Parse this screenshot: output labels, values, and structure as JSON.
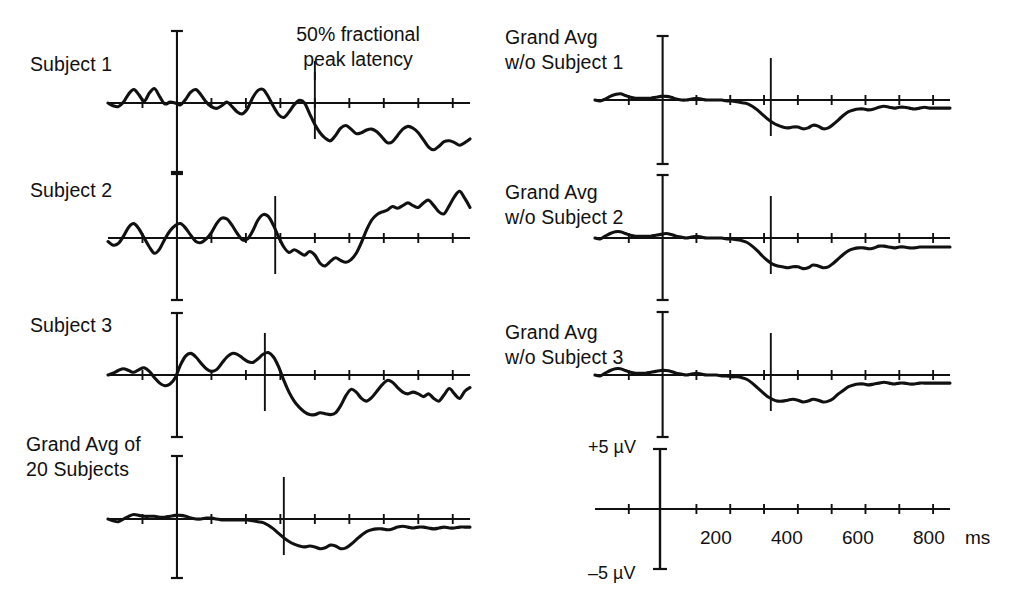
{
  "figure": {
    "title": "",
    "annotation": {
      "line1": "50% fractional",
      "line2": "peak latency"
    },
    "calibration": {
      "positive": "+5 µV",
      "negative": "–5 µV",
      "unit": "ms"
    },
    "time_axis": {
      "tick_labels": [
        "200",
        "400",
        "600",
        "800"
      ],
      "unit_label": "ms",
      "tick_values_ms": [
        -100,
        0,
        100,
        200,
        300,
        400,
        500,
        600,
        700,
        800
      ],
      "range_ms": [
        -200,
        850
      ]
    },
    "left_column": [
      {
        "label": "Subject 1",
        "label_line2": ""
      },
      {
        "label": "Subject 2",
        "label_line2": ""
      },
      {
        "label": "Subject 3",
        "label_line2": ""
      },
      {
        "label": "Grand Avg of",
        "label_line2": "20 Subjects"
      }
    ],
    "right_column": [
      {
        "label": "Grand Avg",
        "label_line2": "w/o Subject 1"
      },
      {
        "label": "Grand Avg",
        "label_line2": "w/o Subject 2"
      },
      {
        "label": "Grand Avg",
        "label_line2": "w/o Subject 3"
      }
    ]
  },
  "chart_data": {
    "type": "line",
    "title": "",
    "xlabel": "ms",
    "ylabel": "µV",
    "xlim": [
      -200,
      850
    ],
    "ylim": [
      -5,
      5
    ],
    "grid": false,
    "legend": "none",
    "xticks": [
      -100,
      0,
      100,
      200,
      300,
      400,
      500,
      600,
      700,
      800
    ],
    "xticklabels": [
      "",
      "",
      "",
      "200",
      "",
      "400",
      "",
      "600",
      "",
      "800"
    ],
    "annotations": [
      {
        "text": "50% fractional peak latency",
        "points_to": "latency-marker-subject-1"
      }
    ],
    "series": [
      {
        "name": "Subject 1",
        "panel": "left-1",
        "latency_marker_ms": 400,
        "x": [
          -200,
          -185,
          -170,
          -155,
          -140,
          -125,
          -110,
          -95,
          -80,
          -65,
          -50,
          -35,
          -20,
          -5,
          10,
          25,
          40,
          55,
          70,
          85,
          100,
          115,
          130,
          145,
          160,
          175,
          190,
          205,
          220,
          235,
          250,
          265,
          280,
          295,
          310,
          325,
          340,
          355,
          370,
          385,
          400,
          415,
          430,
          445,
          460,
          475,
          490,
          505,
          520,
          535,
          550,
          565,
          580,
          595,
          610,
          625,
          640,
          655,
          670,
          685,
          700,
          715,
          730,
          745,
          760,
          775,
          790,
          805,
          820,
          835,
          850
        ],
        "y": [
          0.0,
          -0.3,
          -0.4,
          0.1,
          1.0,
          1.5,
          0.9,
          0.2,
          1.1,
          1.6,
          0.7,
          -0.1,
          0.1,
          0.0,
          -0.2,
          0.4,
          1.2,
          1.5,
          0.9,
          0.1,
          -0.4,
          -0.6,
          -0.3,
          0.1,
          -0.4,
          -1.0,
          -1.2,
          -0.6,
          0.6,
          1.4,
          1.5,
          0.7,
          -0.4,
          -1.3,
          -1.6,
          -1.0,
          -0.2,
          0.3,
          0.0,
          -1.2,
          -2.4,
          -3.3,
          -3.9,
          -4.2,
          -3.6,
          -2.8,
          -2.5,
          -2.9,
          -3.4,
          -3.3,
          -3.0,
          -2.9,
          -3.2,
          -3.8,
          -4.4,
          -4.3,
          -3.6,
          -2.9,
          -2.6,
          -2.8,
          -3.3,
          -4.1,
          -4.9,
          -5.2,
          -4.8,
          -4.3,
          -4.2,
          -4.4,
          -4.7,
          -4.4,
          -4.0
        ]
      },
      {
        "name": "Subject 2",
        "panel": "left-2",
        "latency_marker_ms": 285,
        "x": [
          -200,
          -185,
          -170,
          -155,
          -140,
          -125,
          -110,
          -95,
          -80,
          -65,
          -50,
          -35,
          -20,
          -5,
          10,
          25,
          40,
          55,
          70,
          85,
          100,
          115,
          130,
          145,
          160,
          175,
          190,
          205,
          220,
          235,
          250,
          265,
          280,
          295,
          310,
          325,
          340,
          355,
          370,
          385,
          400,
          415,
          430,
          445,
          460,
          475,
          490,
          505,
          520,
          535,
          550,
          565,
          580,
          595,
          610,
          625,
          640,
          655,
          670,
          685,
          700,
          715,
          730,
          745,
          760,
          775,
          790,
          805,
          820,
          835,
          850
        ],
        "y": [
          -0.4,
          -0.8,
          -0.6,
          0.2,
          1.2,
          1.6,
          1.0,
          0.0,
          -1.0,
          -1.7,
          -1.2,
          -0.1,
          0.8,
          1.4,
          1.6,
          1.1,
          0.3,
          -0.4,
          -0.5,
          -0.1,
          0.6,
          1.6,
          2.2,
          2.1,
          1.4,
          0.5,
          -0.2,
          -0.1,
          0.8,
          2.0,
          2.6,
          2.4,
          1.4,
          0.1,
          -1.0,
          -1.6,
          -1.3,
          -1.6,
          -1.9,
          -1.5,
          -1.9,
          -2.8,
          -3.1,
          -2.6,
          -2.2,
          -2.5,
          -2.7,
          -2.4,
          -1.7,
          -0.5,
          0.9,
          2.0,
          2.6,
          2.9,
          3.1,
          3.5,
          3.3,
          3.6,
          3.9,
          3.6,
          3.4,
          3.9,
          4.2,
          3.6,
          2.9,
          2.7,
          3.6,
          4.6,
          5.2,
          4.4,
          3.4
        ]
      },
      {
        "name": "Subject 3",
        "panel": "left-3",
        "latency_marker_ms": 255,
        "x": [
          -200,
          -185,
          -170,
          -155,
          -140,
          -125,
          -110,
          -95,
          -80,
          -65,
          -50,
          -35,
          -20,
          -5,
          10,
          25,
          40,
          55,
          70,
          85,
          100,
          115,
          130,
          145,
          160,
          175,
          190,
          205,
          220,
          235,
          250,
          265,
          280,
          295,
          310,
          325,
          340,
          355,
          370,
          385,
          400,
          415,
          430,
          445,
          460,
          475,
          490,
          505,
          520,
          535,
          550,
          565,
          580,
          595,
          610,
          625,
          640,
          655,
          670,
          685,
          700,
          715,
          730,
          745,
          760,
          775,
          790,
          805,
          820,
          835,
          850
        ],
        "y": [
          0.0,
          0.2,
          0.5,
          0.7,
          0.5,
          0.3,
          0.6,
          0.8,
          0.4,
          -0.3,
          -0.9,
          -1.2,
          -1.0,
          -0.3,
          1.1,
          2.1,
          2.4,
          2.0,
          1.3,
          0.7,
          0.4,
          0.6,
          1.3,
          2.0,
          2.4,
          2.3,
          1.9,
          1.5,
          1.4,
          1.8,
          2.3,
          2.5,
          2.0,
          0.9,
          -0.6,
          -1.9,
          -2.9,
          -3.6,
          -4.1,
          -4.4,
          -4.4,
          -4.2,
          -4.3,
          -4.4,
          -4.2,
          -3.4,
          -2.3,
          -1.6,
          -1.9,
          -2.6,
          -2.9,
          -2.5,
          -1.8,
          -1.1,
          -0.6,
          -0.8,
          -1.4,
          -1.9,
          -2.1,
          -1.9,
          -2.1,
          -2.4,
          -2.1,
          -2.6,
          -2.9,
          -2.2,
          -1.5,
          -2.1,
          -2.6,
          -1.8,
          -1.4
        ]
      },
      {
        "name": "Grand Avg of 20 Subjects",
        "panel": "left-4",
        "latency_marker_ms": 310,
        "x": [
          -200,
          -185,
          -170,
          -155,
          -140,
          -125,
          -110,
          -95,
          -80,
          -65,
          -50,
          -35,
          -20,
          -5,
          10,
          25,
          40,
          55,
          70,
          85,
          100,
          115,
          130,
          145,
          160,
          175,
          190,
          205,
          220,
          235,
          250,
          265,
          280,
          295,
          310,
          325,
          340,
          355,
          370,
          385,
          400,
          415,
          430,
          445,
          460,
          475,
          490,
          505,
          520,
          535,
          550,
          565,
          580,
          595,
          610,
          625,
          640,
          655,
          670,
          685,
          700,
          715,
          730,
          745,
          760,
          775,
          790,
          805,
          820,
          835,
          850
        ],
        "y": [
          0.0,
          -0.2,
          -0.3,
          0.0,
          0.3,
          0.5,
          0.4,
          0.3,
          0.3,
          0.3,
          0.2,
          0.2,
          0.3,
          0.4,
          0.4,
          0.3,
          0.1,
          0.0,
          0.0,
          0.1,
          0.1,
          0.0,
          -0.1,
          -0.1,
          -0.1,
          -0.1,
          -0.1,
          -0.1,
          -0.2,
          -0.3,
          -0.4,
          -0.7,
          -1.1,
          -1.6,
          -2.1,
          -2.5,
          -2.8,
          -3.0,
          -3.1,
          -3.0,
          -3.1,
          -3.3,
          -3.2,
          -2.9,
          -3.0,
          -3.3,
          -3.2,
          -2.8,
          -2.3,
          -1.8,
          -1.4,
          -1.2,
          -1.1,
          -1.1,
          -1.2,
          -1.1,
          -0.9,
          -0.8,
          -0.9,
          -1.0,
          -0.9,
          -0.9,
          -1.0,
          -1.1,
          -1.0,
          -0.9,
          -1.0,
          -1.0,
          -0.9,
          -0.9,
          -0.9
        ]
      },
      {
        "name": "Grand Avg w/o Subject 1",
        "panel": "right-1",
        "latency_marker_ms": 320,
        "x": [
          -200,
          -185,
          -170,
          -155,
          -140,
          -125,
          -110,
          -95,
          -80,
          -65,
          -50,
          -35,
          -20,
          -5,
          10,
          25,
          40,
          55,
          70,
          85,
          100,
          115,
          130,
          145,
          160,
          175,
          190,
          205,
          220,
          235,
          250,
          265,
          280,
          295,
          310,
          325,
          340,
          355,
          370,
          385,
          400,
          415,
          430,
          445,
          460,
          475,
          490,
          505,
          520,
          535,
          550,
          565,
          580,
          595,
          610,
          625,
          640,
          655,
          670,
          685,
          700,
          715,
          730,
          745,
          760,
          775,
          790,
          805,
          820,
          835,
          850
        ],
        "y": [
          0.0,
          -0.1,
          0.1,
          0.4,
          0.6,
          0.7,
          0.5,
          0.3,
          0.2,
          0.2,
          0.2,
          0.2,
          0.3,
          0.4,
          0.4,
          0.3,
          0.1,
          0.0,
          0.0,
          0.1,
          0.2,
          0.1,
          0.0,
          0.0,
          0.0,
          0.0,
          -0.1,
          -0.1,
          -0.2,
          -0.3,
          -0.4,
          -0.7,
          -1.1,
          -1.6,
          -2.1,
          -2.5,
          -2.8,
          -3.0,
          -3.1,
          -3.0,
          -3.0,
          -3.2,
          -3.1,
          -2.8,
          -2.9,
          -3.2,
          -3.1,
          -2.7,
          -2.2,
          -1.7,
          -1.3,
          -1.1,
          -1.0,
          -1.0,
          -1.1,
          -1.0,
          -0.8,
          -0.7,
          -0.8,
          -0.9,
          -0.8,
          -0.8,
          -0.9,
          -1.0,
          -0.9,
          -0.8,
          -0.9,
          -0.9,
          -0.9,
          -0.9,
          -0.9
        ]
      },
      {
        "name": "Grand Avg w/o Subject 2",
        "panel": "right-2",
        "latency_marker_ms": 320,
        "x": [
          -200,
          -185,
          -170,
          -155,
          -140,
          -125,
          -110,
          -95,
          -80,
          -65,
          -50,
          -35,
          -20,
          -5,
          10,
          25,
          40,
          55,
          70,
          85,
          100,
          115,
          130,
          145,
          160,
          175,
          190,
          205,
          220,
          235,
          250,
          265,
          280,
          295,
          310,
          325,
          340,
          355,
          370,
          385,
          400,
          415,
          430,
          445,
          460,
          475,
          490,
          505,
          520,
          535,
          550,
          565,
          580,
          595,
          610,
          625,
          640,
          655,
          670,
          685,
          700,
          715,
          730,
          745,
          760,
          775,
          790,
          805,
          820,
          835,
          850
        ],
        "y": [
          0.0,
          -0.1,
          0.2,
          0.5,
          0.7,
          0.7,
          0.5,
          0.3,
          0.2,
          0.2,
          0.2,
          0.2,
          0.3,
          0.4,
          0.5,
          0.4,
          0.2,
          0.1,
          0.0,
          0.1,
          0.2,
          0.1,
          0.0,
          0.0,
          0.0,
          0.0,
          -0.1,
          -0.1,
          -0.2,
          -0.3,
          -0.5,
          -0.9,
          -1.4,
          -2.0,
          -2.5,
          -2.9,
          -3.1,
          -3.2,
          -3.3,
          -3.2,
          -3.2,
          -3.4,
          -3.3,
          -3.0,
          -3.1,
          -3.3,
          -3.2,
          -2.8,
          -2.3,
          -1.8,
          -1.4,
          -1.2,
          -1.1,
          -1.1,
          -1.2,
          -1.1,
          -0.9,
          -0.9,
          -1.0,
          -1.1,
          -1.0,
          -1.0,
          -1.1,
          -1.1,
          -1.0,
          -1.0,
          -1.0,
          -1.0,
          -1.0,
          -1.0,
          -1.0
        ]
      },
      {
        "name": "Grand Avg w/o Subject 3",
        "panel": "right-3",
        "latency_marker_ms": 320,
        "x": [
          -200,
          -185,
          -170,
          -155,
          -140,
          -125,
          -110,
          -95,
          -80,
          -65,
          -50,
          -35,
          -20,
          -5,
          10,
          25,
          40,
          55,
          70,
          85,
          100,
          115,
          130,
          145,
          160,
          175,
          190,
          205,
          220,
          235,
          250,
          265,
          280,
          295,
          310,
          325,
          340,
          355,
          370,
          385,
          400,
          415,
          430,
          445,
          460,
          475,
          490,
          505,
          520,
          535,
          550,
          565,
          580,
          595,
          610,
          625,
          640,
          655,
          670,
          685,
          700,
          715,
          730,
          745,
          760,
          775,
          790,
          805,
          820,
          835,
          850
        ],
        "y": [
          0.0,
          -0.1,
          0.2,
          0.5,
          0.7,
          0.7,
          0.5,
          0.3,
          0.2,
          0.2,
          0.2,
          0.3,
          0.4,
          0.5,
          0.5,
          0.4,
          0.2,
          0.1,
          0.0,
          0.1,
          0.2,
          0.1,
          0.0,
          0.0,
          0.0,
          -0.1,
          -0.1,
          -0.2,
          -0.2,
          -0.3,
          -0.5,
          -0.9,
          -1.4,
          -1.9,
          -2.4,
          -2.7,
          -2.9,
          -2.9,
          -2.8,
          -2.7,
          -2.8,
          -3.0,
          -2.9,
          -2.7,
          -2.8,
          -3.0,
          -2.9,
          -2.6,
          -2.1,
          -1.7,
          -1.3,
          -1.1,
          -1.0,
          -1.0,
          -1.1,
          -1.0,
          -0.9,
          -0.8,
          -0.9,
          -1.0,
          -0.9,
          -0.9,
          -1.0,
          -1.0,
          -0.9,
          -0.9,
          -0.9,
          -0.9,
          -0.9,
          -0.9,
          -0.9
        ]
      }
    ]
  }
}
